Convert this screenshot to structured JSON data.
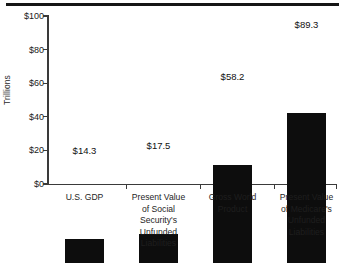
{
  "chart_data": {
    "type": "bar",
    "title": "",
    "subtitle": "",
    "xlabel": "",
    "ylabel": "Trillions",
    "ylim": [
      0,
      100
    ],
    "yticks": [
      "$0",
      "$20",
      "$40",
      "$60",
      "$80",
      "$100"
    ],
    "ytick_values": [
      0,
      20,
      40,
      60,
      80,
      100
    ],
    "grid": false,
    "legend": null,
    "bar_color": "#0d0d0d",
    "categories": [
      "U.S. GDP",
      "Present Value of Social Security's Unfunded Liabilities",
      "Gross World Product",
      "Present Value of Medicare's Unfunded Liabilities"
    ],
    "category_lines": [
      [
        "U.S. GDP"
      ],
      [
        "Present Value",
        "of Social",
        "Security's",
        "Unfunded",
        "Liabilities"
      ],
      [
        "Gross World",
        "Product"
      ],
      [
        "Present Value",
        "of Medicare's",
        "Unfunded",
        "Liabilities"
      ]
    ],
    "values": [
      14.3,
      17.5,
      58.2,
      89.3
    ],
    "value_labels": [
      "$14.3",
      "$17.5",
      "$58.2",
      "$89.3"
    ]
  }
}
